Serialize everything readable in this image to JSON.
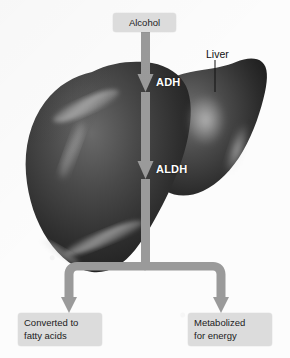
{
  "figure": {
    "background_color": "#fcfcfc",
    "arrow_color": "#9a9a9a",
    "label_box_color": "#dcdcdc",
    "label_text_color": "#1b1b1b",
    "enzyme_text_color": "#ffffff",
    "organ_color": "#3a3a3a"
  },
  "nodes": {
    "input_label": "Alcohol",
    "organ_label": "Liver",
    "outcome_left": "Converted to fatty acids",
    "outcome_left_line1": "Converted to",
    "outcome_left_line2": "fatty acids",
    "outcome_right": "Metabolized for energy",
    "outcome_right_line1": "Metabolized",
    "outcome_right_line2": "for energy"
  },
  "enzymes": [
    {
      "abbr": "ADH",
      "name": "alcohol dehydrogenase"
    },
    {
      "abbr": "ALDH",
      "name": "aldehyde dehydrogenase"
    }
  ],
  "enzyme_labels": {
    "first": "ADH",
    "second": "ALDH"
  },
  "flow": {
    "steps": [
      "Alcohol",
      "ADH",
      "ALDH",
      "Converted to fatty acids",
      "Metabolized for energy"
    ],
    "branch_count": 2
  }
}
